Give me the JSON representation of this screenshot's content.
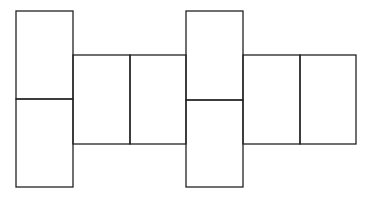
{
  "diagram": {
    "type": "net-of-rectangular-prism",
    "stroke_color": "#222222",
    "background_color": "#ffffff",
    "faces": [
      {
        "id": "face-1",
        "x": 16,
        "y": 11,
        "w": 57,
        "h": 88
      },
      {
        "id": "face-2",
        "x": 16,
        "y": 99,
        "w": 57,
        "h": 88
      },
      {
        "id": "face-3",
        "x": 73,
        "y": 55,
        "w": 57,
        "h": 89
      },
      {
        "id": "face-4",
        "x": 130,
        "y": 55,
        "w": 56,
        "h": 89
      },
      {
        "id": "face-5",
        "x": 186,
        "y": 11,
        "w": 57,
        "h": 89
      },
      {
        "id": "face-6",
        "x": 186,
        "y": 100,
        "w": 57,
        "h": 87
      },
      {
        "id": "face-7",
        "x": 243,
        "y": 55,
        "w": 57,
        "h": 89
      },
      {
        "id": "face-8",
        "x": 300,
        "y": 55,
        "w": 56,
        "h": 89
      }
    ]
  }
}
